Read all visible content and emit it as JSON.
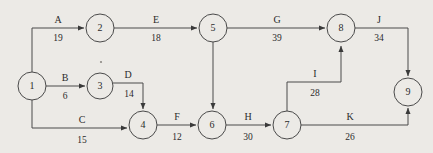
{
  "diagram": {
    "background_color": "#eceae6",
    "line_color": "#4a4a4a",
    "text_color": "#2b2b2b",
    "nodes": [
      {
        "id": "1",
        "label": "1",
        "cx": 32,
        "cy": 86,
        "r": 14
      },
      {
        "id": "2",
        "label": "2",
        "cx": 100,
        "cy": 28,
        "r": 14
      },
      {
        "id": "3",
        "label": "3",
        "cx": 100,
        "cy": 86,
        "r": 13
      },
      {
        "id": "4",
        "label": "4",
        "cx": 143,
        "cy": 125,
        "r": 14
      },
      {
        "id": "5",
        "label": "5",
        "cx": 213,
        "cy": 28,
        "r": 14
      },
      {
        "id": "6",
        "label": "6",
        "cx": 212,
        "cy": 125,
        "r": 14
      },
      {
        "id": "7",
        "label": "7",
        "cx": 287,
        "cy": 125,
        "r": 14
      },
      {
        "id": "8",
        "label": "8",
        "cx": 341,
        "cy": 28,
        "r": 14
      },
      {
        "id": "9",
        "label": "9",
        "cx": 408,
        "cy": 92,
        "r": 14
      }
    ],
    "edges": [
      {
        "name": "A",
        "value": "19",
        "from": "1",
        "to": "2",
        "path": "M 32 72 L 32 28 L 84 28",
        "name_x": 58,
        "name_y": 23,
        "value_x": 58,
        "value_y": 41
      },
      {
        "name": "B",
        "value": "6",
        "from": "1",
        "to": "3",
        "path": "M 46 86 L 85 86",
        "name_x": 65,
        "name_y": 81,
        "value_x": 65,
        "value_y": 99
      },
      {
        "name": "C",
        "value": "15",
        "from": "1",
        "to": "4",
        "path": "M 32 100 L 32 128 L 127 128",
        "name_x": 82,
        "name_y": 123,
        "value_x": 82,
        "value_y": 143
      },
      {
        "name": "D",
        "value": "14",
        "from": "3",
        "to": "4",
        "path": "M 113 83 L 143 83 L 143 109",
        "name_x": 128,
        "name_y": 78,
        "value_x": 129,
        "value_y": 97
      },
      {
        "name": "E",
        "value": "18",
        "from": "2",
        "to": "5",
        "path": "M 114 28 L 197 28",
        "name_x": 156,
        "name_y": 23,
        "value_x": 156,
        "value_y": 41
      },
      {
        "name": "F",
        "value": "12",
        "from": "4",
        "to": "6",
        "path": "M 157 125 L 196 125",
        "name_x": 177,
        "name_y": 120,
        "value_x": 177,
        "value_y": 140
      },
      {
        "name": "G",
        "value": "39",
        "from": "5",
        "to": "8",
        "path": "M 227 28 L 325 28",
        "name_x": 277,
        "name_y": 23,
        "value_x": 277,
        "value_y": 41
      },
      {
        "name": "H",
        "value": "30",
        "from": "6",
        "to": "7",
        "path": "M 226 125 L 271 125",
        "name_x": 248,
        "name_y": 120,
        "value_x": 248,
        "value_y": 140
      },
      {
        "name": "I",
        "value": "28",
        "from": "7",
        "to": "8",
        "path": "M 287 111 L 287 82 L 341 82 L 341 46",
        "name_x": 315,
        "name_y": 77,
        "value_x": 315,
        "value_y": 96
      },
      {
        "name": "J",
        "value": "34",
        "from": "8",
        "to": "9",
        "path": "M 355 28 L 408 28 L 408 76",
        "name_x": 379,
        "name_y": 23,
        "value_x": 379,
        "value_y": 41
      },
      {
        "name": "K",
        "value": "26",
        "from": "7",
        "to": "9",
        "path": "M 301 125 L 408 125 L 408 108",
        "name_x": 350,
        "name_y": 120,
        "value_x": 350,
        "value_y": 140
      },
      {
        "name": "",
        "value": "",
        "from": "5",
        "to": "6",
        "path": "M 213 42 L 213 109",
        "name_x": 0,
        "name_y": 0,
        "value_x": 0,
        "value_y": 0
      }
    ],
    "artifacts": [
      {
        "name": "speck-above-node-3",
        "cx": 101,
        "cy": 62,
        "r": 1.1
      }
    ]
  }
}
